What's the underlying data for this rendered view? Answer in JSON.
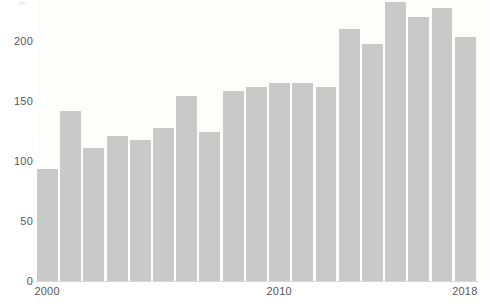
{
  "chart_data": {
    "type": "bar",
    "title": "",
    "subtitle": "",
    "xlabel": "",
    "ylabel": "",
    "categories": [
      "2000",
      "2001",
      "2002",
      "2003",
      "2004",
      "2005",
      "2006",
      "2007",
      "2008",
      "2009",
      "2010",
      "2011",
      "2012",
      "2013",
      "2014",
      "2015",
      "2016",
      "2017",
      "2018"
    ],
    "values": [
      94,
      142,
      111,
      121,
      118,
      128,
      155,
      125,
      159,
      162,
      166,
      166,
      162,
      211,
      198,
      233,
      221,
      228,
      204
    ],
    "ylim": [
      0,
      235
    ],
    "xlim": [
      "2000",
      "2018"
    ],
    "y_ticks": [
      0,
      50,
      100,
      150,
      200
    ],
    "y_tick_labels": [
      "0",
      "50",
      "100",
      "150",
      "200"
    ],
    "x_tick_labels": [
      "2000",
      "2010",
      "2018"
    ],
    "grid": false,
    "legend": null,
    "bar_color": "#c9c9c9",
    "axis_color": "#d9d9d9",
    "text_color": "#55585a",
    "background_color": "#ffffff"
  }
}
